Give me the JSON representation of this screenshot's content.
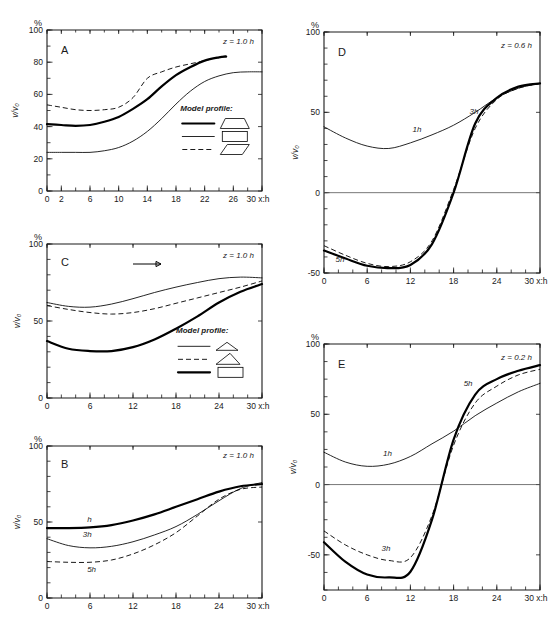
{
  "figure": {
    "axis_titles": {
      "y": "v/v₀",
      "percent": "%",
      "x_end": "30 x:h"
    }
  },
  "chart_data": [
    {
      "id": "A",
      "type": "line",
      "panel_label": "A",
      "annotation": "z = 1.0 h",
      "xlabel": "x/h",
      "ylabel": "v/v₀",
      "ylim": [
        0,
        100
      ],
      "xlim": [
        0,
        30
      ],
      "yticks": [
        0,
        20,
        40,
        60,
        80,
        100
      ],
      "xticks": [
        0,
        2,
        6,
        10,
        14,
        18,
        22,
        26,
        30
      ],
      "xtick_labels": [
        "0",
        "2",
        "6",
        "10",
        "14",
        "18",
        "22",
        "26",
        "30 x:h"
      ],
      "grid": false,
      "legend_title": "Model profile:",
      "legend": [
        {
          "style": "thick",
          "shape": "trapezoid"
        },
        {
          "style": "thin",
          "shape": "rectangle"
        },
        {
          "style": "dashed",
          "shape": "parallelogram"
        }
      ],
      "series": [
        {
          "name": "trapezoid-profile",
          "style": "thick",
          "x": [
            0,
            2,
            4,
            6,
            8,
            10,
            12,
            14,
            16,
            18,
            20,
            22,
            24,
            25
          ],
          "values": [
            41.5,
            41,
            40.5,
            41,
            43,
            46,
            51,
            57,
            65,
            72,
            77,
            81,
            83,
            83.5
          ]
        },
        {
          "name": "rectangle-profile",
          "style": "thin",
          "x": [
            0,
            2,
            4,
            6,
            8,
            10,
            12,
            14,
            16,
            18,
            20,
            22,
            24,
            26,
            28,
            30
          ],
          "values": [
            24,
            24,
            24,
            24,
            25,
            27,
            31,
            37,
            45,
            54,
            62,
            68,
            71.5,
            73.5,
            74,
            74
          ]
        },
        {
          "name": "parallelogram-profile",
          "style": "dashed",
          "x": [
            0,
            2,
            4,
            6,
            8,
            10,
            12,
            14,
            16,
            18,
            20,
            22,
            24,
            25
          ],
          "values": [
            53.5,
            52,
            50.5,
            50,
            50.5,
            52,
            58,
            70,
            74,
            77,
            79,
            81,
            83,
            84
          ]
        }
      ]
    },
    {
      "id": "C",
      "type": "line",
      "panel_label": "C",
      "annotation": "z = 1.0 h",
      "xlabel": "x/h",
      "ylabel": "v/v₀",
      "ylim": [
        0,
        100
      ],
      "xlim": [
        0,
        30
      ],
      "yticks": [
        0,
        50,
        100
      ],
      "xticks": [
        0,
        6,
        12,
        18,
        24,
        30
      ],
      "xtick_labels": [
        "0",
        "6",
        "12",
        "18",
        "24",
        "30 x:h"
      ],
      "grid": false,
      "flow_arrow": true,
      "legend_title": "Model profile:",
      "legend": [
        {
          "style": "thin",
          "shape": "flat-triangle"
        },
        {
          "style": "dashed",
          "shape": "triangle"
        },
        {
          "style": "thick",
          "shape": "rectangle"
        }
      ],
      "series": [
        {
          "name": "flat-triangle-profile",
          "style": "thin",
          "x": [
            0,
            3,
            6,
            9,
            12,
            15,
            18,
            21,
            24,
            27,
            30
          ],
          "values": [
            62,
            59.5,
            59,
            61,
            64.5,
            68.5,
            72,
            75,
            77.5,
            78.5,
            78
          ]
        },
        {
          "name": "triangle-profile",
          "style": "dashed",
          "x": [
            0,
            3,
            6,
            9,
            12,
            15,
            18,
            21,
            24,
            27,
            30
          ],
          "values": [
            60,
            57.5,
            55.5,
            54.5,
            55.5,
            58,
            61.5,
            65,
            68.5,
            72,
            76
          ]
        },
        {
          "name": "rectangle-profile",
          "style": "thick",
          "x": [
            0,
            3,
            6,
            9,
            12,
            15,
            18,
            21,
            24,
            27,
            30
          ],
          "values": [
            37,
            32,
            30.5,
            30.5,
            33,
            38,
            45,
            53,
            62,
            69,
            74
          ]
        }
      ]
    },
    {
      "id": "B",
      "type": "line",
      "panel_label": "B",
      "annotation": "z = 1.0 h",
      "xlabel": "x/h",
      "ylabel": "v/v₀",
      "ylim": [
        0,
        100
      ],
      "xlim": [
        0,
        30
      ],
      "yticks": [
        0,
        50,
        100
      ],
      "xticks": [
        0,
        6,
        12,
        18,
        24,
        30
      ],
      "xtick_labels": [
        "0",
        "6",
        "12",
        "18",
        "24",
        "30 x:h"
      ],
      "grid": false,
      "series": [
        {
          "name": "h-curve",
          "style": "thick",
          "label": "h",
          "x": [
            0,
            3,
            6,
            9,
            12,
            15,
            18,
            21,
            24,
            27,
            30
          ],
          "values": [
            46,
            46,
            46.5,
            48,
            51,
            55,
            60,
            65,
            70,
            73.5,
            75
          ]
        },
        {
          "name": "3h-curve",
          "style": "thin",
          "label": "3h",
          "x": [
            0,
            3,
            6,
            9,
            12,
            15,
            18,
            21,
            24,
            27,
            30
          ],
          "values": [
            39,
            34.5,
            33,
            34,
            37,
            41.5,
            47,
            55,
            64,
            72,
            76
          ]
        },
        {
          "name": "5h-curve",
          "style": "dashed",
          "label": "5h",
          "x": [
            0,
            3,
            6,
            9,
            12,
            15,
            18,
            21,
            24,
            27,
            30
          ],
          "values": [
            24,
            23.5,
            23.5,
            25,
            29,
            35,
            43,
            54,
            65,
            71.5,
            73
          ]
        }
      ]
    },
    {
      "id": "D",
      "type": "line",
      "panel_label": "D",
      "annotation": "z = 0.6 h",
      "xlabel": "x/h",
      "ylabel": "v/v₀",
      "ylim": [
        -50,
        100
      ],
      "xlim": [
        0,
        30
      ],
      "yticks": [
        -50,
        0,
        50,
        100
      ],
      "xticks": [
        0,
        6,
        12,
        18,
        24,
        30
      ],
      "xtick_labels": [
        "0",
        "6",
        "12",
        "18",
        "24",
        "30 x:h"
      ],
      "grid": false,
      "zero_line": true,
      "series": [
        {
          "name": "1h-curve",
          "style": "thin",
          "label": "1h",
          "x": [
            0,
            3,
            6,
            9,
            12,
            15,
            18,
            21,
            24,
            27,
            30
          ],
          "values": [
            41,
            34,
            29,
            27.5,
            31,
            36,
            42,
            50,
            59,
            65,
            68
          ]
        },
        {
          "name": "3h-curve",
          "style": "dashed",
          "label": "3h",
          "x": [
            0,
            3,
            6,
            9,
            12,
            15,
            18,
            21,
            24,
            27,
            30
          ],
          "values": [
            -33,
            -39,
            -44,
            -46,
            -43,
            -30,
            2,
            40,
            58,
            65,
            68
          ]
        },
        {
          "name": "5h-curve",
          "style": "thick",
          "label": "5h",
          "x": [
            0,
            3,
            6,
            9,
            12,
            15,
            18,
            21,
            24,
            27,
            30
          ],
          "values": [
            -36,
            -41,
            -45.5,
            -47,
            -45,
            -32,
            0,
            43,
            59,
            66,
            68
          ]
        }
      ]
    },
    {
      "id": "E",
      "type": "line",
      "panel_label": "E",
      "annotation": "z = 0.2 h",
      "xlabel": "x/h",
      "ylabel": "v/v₀",
      "ylim": [
        -75,
        100
      ],
      "xlim": [
        0,
        30
      ],
      "yticks": [
        -50,
        0,
        50,
        100
      ],
      "xticks": [
        0,
        6,
        12,
        18,
        24,
        30
      ],
      "xtick_labels": [
        "0",
        "6",
        "12",
        "18",
        "24",
        "30 x:h"
      ],
      "grid": false,
      "zero_line": true,
      "series": [
        {
          "name": "1h-curve",
          "style": "thin",
          "label": "1h",
          "x": [
            0,
            3,
            6,
            9,
            12,
            15,
            18,
            21,
            24,
            27,
            30
          ],
          "values": [
            23,
            16,
            13,
            14.5,
            20,
            29,
            38,
            49,
            58,
            66,
            72
          ]
        },
        {
          "name": "3h-curve",
          "style": "dashed",
          "label": "3h",
          "x": [
            0,
            3,
            6,
            9,
            12,
            15,
            18,
            21,
            24,
            27,
            30
          ],
          "values": [
            -33,
            -43,
            -50,
            -54,
            -52,
            -22,
            28,
            58,
            70,
            78,
            82
          ]
        },
        {
          "name": "5h-curve",
          "style": "thick",
          "label": "5h",
          "x": [
            0,
            3,
            6,
            9,
            12,
            15,
            18,
            21,
            24,
            27,
            30
          ],
          "values": [
            -41,
            -55,
            -64,
            -66,
            -62,
            -25,
            32,
            64,
            75,
            81,
            85
          ]
        }
      ]
    }
  ]
}
